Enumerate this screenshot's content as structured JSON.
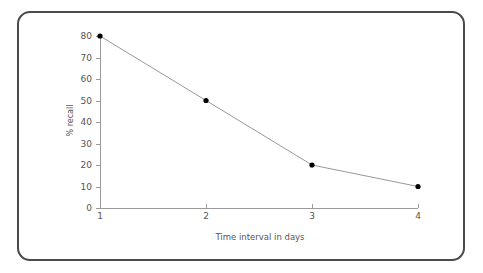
{
  "chart_data": {
    "type": "line",
    "title": "",
    "xlabel": "Time interval in days",
    "ylabel": "% recall",
    "x": [
      1,
      2,
      3,
      4
    ],
    "values": [
      80,
      50,
      20,
      10
    ],
    "xticks": [
      "1",
      "2",
      "3",
      "4"
    ],
    "yticks": [
      "0",
      "10",
      "20",
      "30",
      "40",
      "50",
      "60",
      "70",
      "80"
    ],
    "xlim": [
      1,
      4
    ],
    "ylim": [
      0,
      80
    ],
    "grid": false,
    "legend": null,
    "series": [
      {
        "name": "% recall",
        "values": [
          80,
          50,
          20,
          10
        ],
        "marker": "circle",
        "marker_color": "#000000",
        "line_color": "#999999"
      }
    ]
  },
  "style": {
    "frame_border_color": "#4a4a4a",
    "axis_color": "#9a9a9a",
    "text_color": "#555555",
    "background": "#ffffff"
  }
}
